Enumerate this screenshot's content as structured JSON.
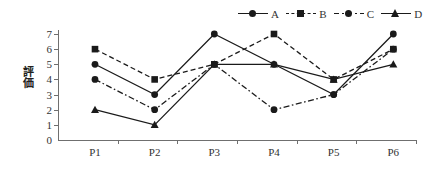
{
  "chart_data": {
    "type": "line",
    "title": "",
    "xlabel": "",
    "ylabel": "評価",
    "categories": [
      "P1",
      "P2",
      "P3",
      "P4",
      "P5",
      "P6"
    ],
    "ylim": [
      0,
      7
    ],
    "yticks": [
      0,
      1,
      2,
      3,
      4,
      5,
      6,
      7
    ],
    "grid": false,
    "legend_position": "top-right",
    "series": [
      {
        "name": "A",
        "values": [
          5,
          3,
          7,
          5,
          3,
          7
        ],
        "line_style": "solid",
        "marker": "circle",
        "color": "#1a1a1a"
      },
      {
        "name": "B",
        "values": [
          6,
          4,
          5,
          7,
          4,
          6
        ],
        "line_style": "dashed",
        "marker": "square",
        "color": "#1a1a1a"
      },
      {
        "name": "C",
        "values": [
          4,
          2,
          5,
          2,
          3,
          6
        ],
        "line_style": "dashdot",
        "marker": "circle",
        "color": "#1a1a1a"
      },
      {
        "name": "D",
        "values": [
          2,
          1,
          5,
          5,
          4,
          5
        ],
        "line_style": "solid",
        "marker": "triangle",
        "color": "#1a1a1a"
      }
    ]
  },
  "axis": {
    "axis_color": "#6f6f6f",
    "tick_label_color": "#333333"
  }
}
